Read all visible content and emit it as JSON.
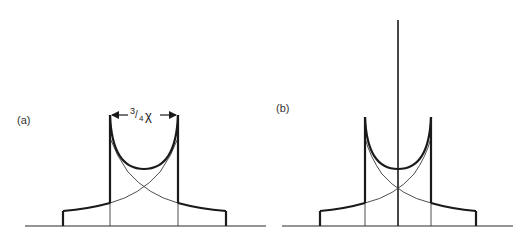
{
  "figure": {
    "panels": [
      {
        "id": "a",
        "label": "(a)",
        "dimension_label_num": "3",
        "dimension_label_slash": "/",
        "dimension_label_den": "4",
        "dimension_label_symbol": "χ",
        "has_center_line": false
      },
      {
        "id": "b",
        "label": "(b)",
        "has_center_line": true
      }
    ]
  },
  "colors": {
    "line": "#1a1a1a",
    "background": "#ffffff"
  }
}
